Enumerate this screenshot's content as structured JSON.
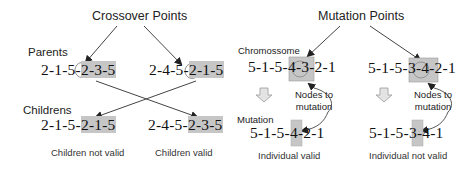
{
  "crossover": {
    "title": "Crossover Points",
    "parents_label": "Parents",
    "childrens_label": "Childrens",
    "parent1": {
      "prefix": "2-1-5-",
      "segment": "2-3-5"
    },
    "parent2": {
      "prefix": "2-4-5-",
      "segment": "2-1-5"
    },
    "child1": {
      "prefix": "2-1-5-",
      "segment": "2-1-5",
      "caption": "Children not valid"
    },
    "child2": {
      "prefix": "2-4-5-",
      "segment": "2-3-5",
      "caption": "Children valid"
    }
  },
  "mutation": {
    "title": "Mutation Points",
    "chromosome_label": "Chromosome",
    "chromosome_label_text": "Chromossome",
    "mutation_label": "Mutation",
    "nodes_label_line1": "Nodes to",
    "nodes_label_line2": "mutation",
    "left": {
      "original": {
        "prefix": "5-1-5-4-",
        "segment": "3-2",
        "suffix": "-1"
      },
      "mutated": {
        "prefix": "5-1-5-4-",
        "segment": "2",
        "suffix": "-1"
      },
      "caption": "Individual valid"
    },
    "right": {
      "original": {
        "prefix": "5-1-5-3-",
        "segment": "4-2",
        "suffix": "-1"
      },
      "mutated": {
        "prefix": "5-1-5-3-",
        "segment": "4",
        "suffix": "-1"
      },
      "caption": "Individual not valid"
    }
  },
  "colors": {
    "highlight": "#c6c6c6",
    "arrow": "#333333",
    "down_arrow_fill": "#e4e4e4",
    "down_arrow_stroke": "#9a9a9a"
  }
}
